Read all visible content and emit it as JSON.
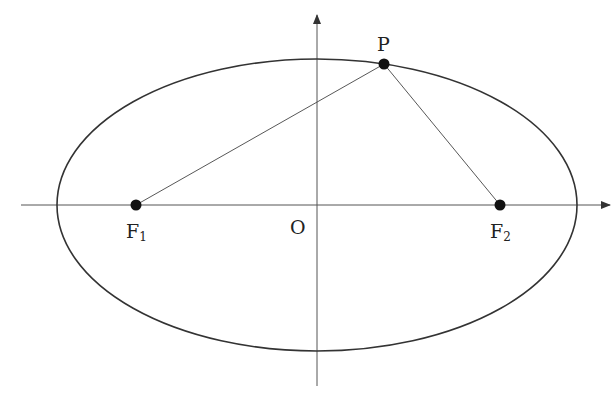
{
  "diagram": {
    "type": "ellipse-with-foci",
    "canvas": {
      "width": 612,
      "height": 397,
      "background": "#ffffff"
    },
    "colors": {
      "stroke": "#333333",
      "axis": "#555555",
      "point": "#111111",
      "text": "#222222"
    },
    "axes": {
      "x_axis": {
        "x1": 21,
        "y": 205,
        "x2": 610,
        "arrow": true
      },
      "y_axis": {
        "x": 317,
        "y1": 386,
        "y2": 15,
        "arrow": true
      }
    },
    "ellipse": {
      "cx": 317,
      "cy": 205,
      "rx": 260,
      "ry": 146
    },
    "points": {
      "P": {
        "label": "P",
        "x": 384,
        "y": 64
      },
      "F1": {
        "label": "F",
        "subscript": "1",
        "x": 136,
        "y": 205
      },
      "F2": {
        "label": "F",
        "subscript": "2",
        "x": 500,
        "y": 205
      }
    },
    "origin": {
      "label": "O",
      "x": 317,
      "y": 205
    },
    "segments": [
      {
        "from": "F1",
        "to": "P"
      },
      {
        "from": "P",
        "to": "F2"
      }
    ]
  }
}
